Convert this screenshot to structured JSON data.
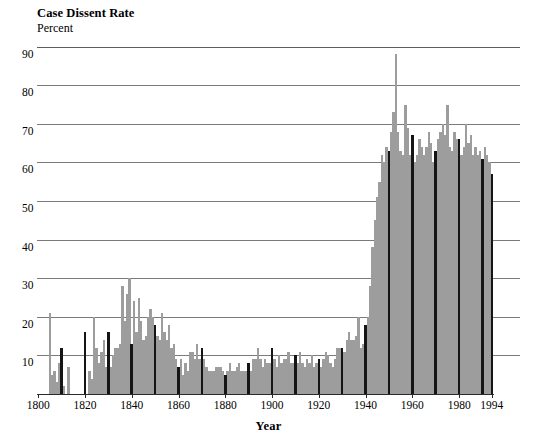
{
  "chart_data": {
    "type": "bar",
    "title": "Case Dissent Rate",
    "subtitle": "Percent",
    "ylabel": "Percent",
    "xlabel": "Year",
    "ylim": [
      0,
      92
    ],
    "xlim": [
      1800,
      1995
    ],
    "grid": true,
    "legend": "none",
    "ytick_labels": [
      "10",
      "20",
      "30",
      "40",
      "50",
      "60",
      "70",
      "80",
      "90"
    ],
    "ytick_values": [
      10,
      20,
      30,
      40,
      50,
      60,
      70,
      80,
      90
    ],
    "xtick_labels": [
      "1800",
      "1820",
      "1840",
      "1860",
      "1880",
      "1900",
      "1920",
      "1940",
      "1960",
      "1980",
      "1994"
    ],
    "xtick_values": [
      1800,
      1820,
      1840,
      1860,
      1880,
      1900,
      1920,
      1940,
      1960,
      1980,
      1994
    ],
    "colors": {
      "bar_light": "#9d9d9d",
      "bar_dark": "#151515",
      "gridline": "#7b7b7b",
      "axis": "#2a2a2a",
      "background": "#ffffff"
    },
    "highlight_years": [
      1810,
      1820,
      1830,
      1840,
      1850,
      1860,
      1870,
      1880,
      1890,
      1900,
      1910,
      1920,
      1930,
      1940,
      1950,
      1960,
      1970,
      1980,
      1990,
      1994
    ],
    "x": [
      1800,
      1801,
      1802,
      1803,
      1804,
      1805,
      1806,
      1807,
      1808,
      1809,
      1810,
      1811,
      1812,
      1813,
      1814,
      1815,
      1816,
      1817,
      1818,
      1819,
      1820,
      1821,
      1822,
      1823,
      1824,
      1825,
      1826,
      1827,
      1828,
      1829,
      1830,
      1831,
      1832,
      1833,
      1834,
      1835,
      1836,
      1837,
      1838,
      1839,
      1840,
      1841,
      1842,
      1843,
      1844,
      1845,
      1846,
      1847,
      1848,
      1849,
      1850,
      1851,
      1852,
      1853,
      1854,
      1855,
      1856,
      1857,
      1858,
      1859,
      1860,
      1861,
      1862,
      1863,
      1864,
      1865,
      1866,
      1867,
      1868,
      1869,
      1870,
      1871,
      1872,
      1873,
      1874,
      1875,
      1876,
      1877,
      1878,
      1879,
      1880,
      1881,
      1882,
      1883,
      1884,
      1885,
      1886,
      1887,
      1888,
      1889,
      1890,
      1891,
      1892,
      1893,
      1894,
      1895,
      1896,
      1897,
      1898,
      1899,
      1900,
      1901,
      1902,
      1903,
      1904,
      1905,
      1906,
      1907,
      1908,
      1909,
      1910,
      1911,
      1912,
      1913,
      1914,
      1915,
      1916,
      1917,
      1918,
      1919,
      1920,
      1921,
      1922,
      1923,
      1924,
      1925,
      1926,
      1927,
      1928,
      1929,
      1930,
      1931,
      1932,
      1933,
      1934,
      1935,
      1936,
      1937,
      1938,
      1939,
      1940,
      1941,
      1942,
      1943,
      1944,
      1945,
      1946,
      1947,
      1948,
      1949,
      1950,
      1951,
      1952,
      1953,
      1954,
      1955,
      1956,
      1957,
      1958,
      1959,
      1960,
      1961,
      1962,
      1963,
      1964,
      1965,
      1966,
      1967,
      1968,
      1969,
      1970,
      1971,
      1972,
      1973,
      1974,
      1975,
      1976,
      1977,
      1978,
      1979,
      1980,
      1981,
      1982,
      1983,
      1984,
      1985,
      1986,
      1987,
      1988,
      1989,
      1990,
      1991,
      1992,
      1993,
      1994
    ],
    "values": [
      0,
      0,
      0,
      0,
      0,
      21,
      5,
      6,
      3,
      8,
      12,
      2,
      0,
      7,
      0,
      0,
      0,
      0,
      0,
      0,
      16,
      0,
      6,
      4,
      20,
      12,
      8,
      11,
      14,
      7,
      16,
      7,
      10,
      12,
      12,
      13,
      28,
      19,
      26,
      30,
      13,
      24,
      16,
      25,
      19,
      14,
      15,
      20,
      22,
      20,
      18,
      15,
      14,
      21,
      16,
      14,
      18,
      12,
      13,
      9,
      7,
      9,
      5,
      8,
      6,
      11,
      11,
      9,
      13,
      9,
      12,
      9,
      7,
      6,
      6,
      6,
      7,
      7,
      7,
      6,
      5,
      6,
      8,
      6,
      6,
      7,
      8,
      6,
      6,
      6,
      8,
      6,
      9,
      9,
      12,
      9,
      7,
      9,
      8,
      8,
      12,
      9,
      7,
      10,
      8,
      9,
      9,
      11,
      8,
      8,
      10,
      8,
      11,
      8,
      7,
      9,
      8,
      10,
      7,
      8,
      9,
      7,
      9,
      11,
      10,
      8,
      7,
      9,
      12,
      12,
      12,
      11,
      14,
      16,
      14,
      14,
      15,
      20,
      12,
      13,
      18,
      20,
      28,
      38,
      45,
      51,
      55,
      62,
      60,
      64,
      63,
      68,
      73,
      88,
      68,
      63,
      62,
      75,
      69,
      62,
      67,
      60,
      62,
      66,
      64,
      62,
      64,
      68,
      65,
      60,
      63,
      66,
      68,
      70,
      67,
      75,
      64,
      63,
      68,
      66,
      66,
      62,
      64,
      70,
      65,
      67,
      62,
      64,
      62,
      63,
      61,
      64,
      62,
      60,
      57
    ]
  }
}
